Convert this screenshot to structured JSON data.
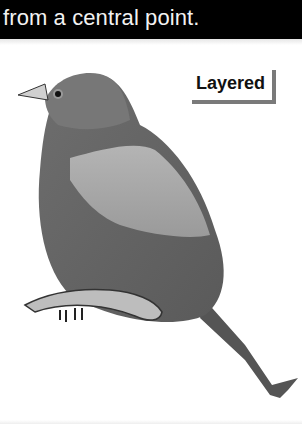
{
  "caption": {
    "text": "from a central point."
  },
  "figure": {
    "label": "Layered",
    "colors": {
      "caption_bg": "#000000",
      "caption_text": "#f2f2f2",
      "label_shadow": "#7a7a7a"
    }
  }
}
